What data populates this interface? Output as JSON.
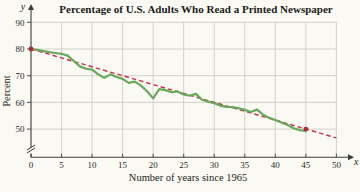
{
  "figure": {
    "background_color": "#fbf9f3",
    "grid_color": "#c9c7c2",
    "axis_color": "#3c3c3c"
  },
  "chart_data": {
    "type": "line",
    "title": "Percentage of U.S. Adults Who Read a Printed Newspaper",
    "xlabel": "Number of years since 1965",
    "ylabel": "Percent",
    "x_axis_symbol": "x",
    "y_axis_symbol": "y",
    "x_ticks": [
      0,
      5,
      10,
      15,
      20,
      25,
      30,
      35,
      40,
      45,
      50
    ],
    "y_ticks": [
      50,
      60,
      70,
      80,
      90
    ],
    "xlim": [
      0,
      52
    ],
    "ylim": [
      45,
      92
    ],
    "y_axis_break_below": 50,
    "grid": true,
    "legend": "none",
    "series": [
      {
        "name": "readership",
        "style": "solid",
        "color": "#67a95b",
        "x": [
          0,
          1,
          2,
          3,
          4,
          5,
          6,
          7,
          8,
          9,
          10,
          11,
          12,
          13,
          14,
          15,
          16,
          17,
          18,
          19,
          20,
          21,
          22,
          23,
          24,
          25,
          26,
          27,
          28,
          29,
          30,
          31,
          32,
          33,
          34,
          35,
          36,
          37,
          38,
          39,
          40,
          41,
          42,
          43,
          44,
          45
        ],
        "values": [
          80,
          79.7,
          79.2,
          78.8,
          78.5,
          78.2,
          77.5,
          75.5,
          73.5,
          72.6,
          72.3,
          70.5,
          69.2,
          70.5,
          69.5,
          68.8,
          67.3,
          67.8,
          66.3,
          64.2,
          61.5,
          65,
          64.6,
          63.8,
          64.1,
          63,
          62.5,
          63.2,
          61,
          60.3,
          59.7,
          58.8,
          58.3,
          58.2,
          57.8,
          57.2,
          56.4,
          57.3,
          55.4,
          54.2,
          53.4,
          52.5,
          51.5,
          50.3,
          49.6,
          49.3
        ]
      },
      {
        "name": "trend",
        "style": "dashed",
        "color": "#c5304a",
        "x": [
          0,
          50
        ],
        "values": [
          80,
          46.7
        ]
      }
    ],
    "marked_points": [
      {
        "x": 0,
        "y": 80
      },
      {
        "x": 45,
        "y": 50
      }
    ],
    "marked_point_color": "#ad2740"
  }
}
